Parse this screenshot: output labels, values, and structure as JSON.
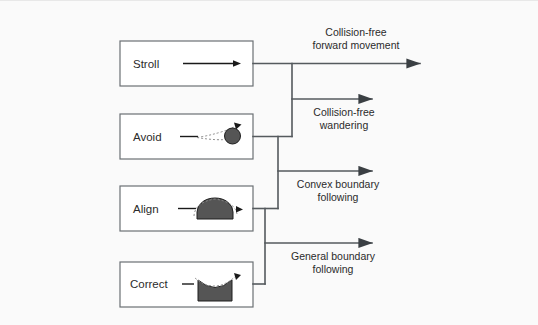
{
  "diagram": {
    "background_color": "#fafafa",
    "line_color": "#555a5e",
    "box_border_color": "#6b7074",
    "shape_fill_color": "#555555",
    "behaviors": [
      {
        "id": "stroll",
        "label": "Stroll",
        "icon": "straight-arrow-icon"
      },
      {
        "id": "avoid",
        "label": "Avoid",
        "icon": "circle-obstacle-icon"
      },
      {
        "id": "align",
        "label": "Align",
        "icon": "convex-dome-icon"
      },
      {
        "id": "correct",
        "label": "Correct",
        "icon": "concave-notch-icon"
      }
    ],
    "outputs": [
      {
        "id": "collision-free-forward-movement",
        "line1": "Collision-free",
        "line2": "forward movement",
        "label_position": "above"
      },
      {
        "id": "collision-free-wandering",
        "line1": "Collision-free",
        "line2": "wandering",
        "label_position": "below"
      },
      {
        "id": "convex-boundary-following",
        "line1": "Convex boundary",
        "line2": "following",
        "label_position": "below"
      },
      {
        "id": "general-boundary-following",
        "line1": "General boundary",
        "line2": "following",
        "label_position": "below"
      }
    ]
  }
}
